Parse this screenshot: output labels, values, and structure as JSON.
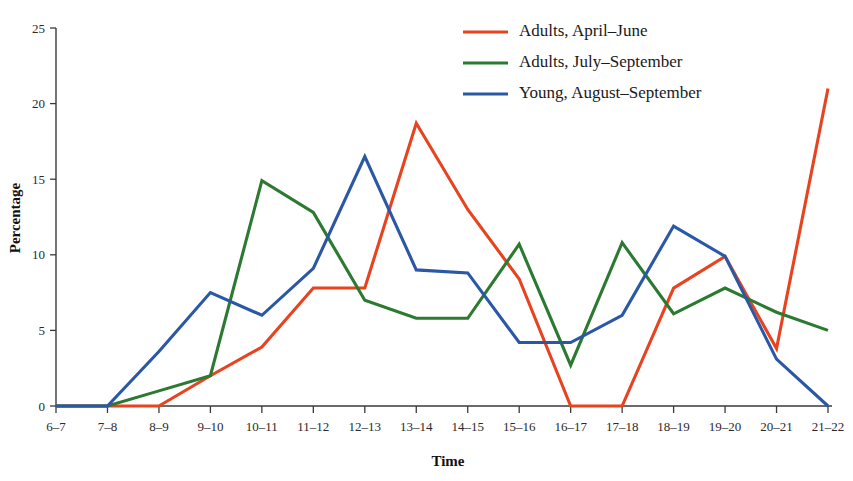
{
  "chart_data": {
    "type": "line",
    "title": "",
    "xlabel": "Time",
    "ylabel": "Percentage",
    "ylim": [
      0,
      25
    ],
    "yticks": [
      0,
      5,
      10,
      15,
      20,
      25
    ],
    "grid": false,
    "legend_position": "top-right",
    "categories": [
      "6–7",
      "7–8",
      "8–9",
      "9–10",
      "10–11",
      "11–12",
      "12–13",
      "13–14",
      "14–15",
      "15–16",
      "16–17",
      "17–18",
      "18–19",
      "19–20",
      "20–21",
      "21–22"
    ],
    "series": [
      {
        "name": "Adults, April–June",
        "color": "#e8431f",
        "values": [
          0,
          0,
          0,
          2.0,
          3.9,
          7.8,
          7.8,
          18.7,
          13.0,
          8.4,
          0,
          0,
          7.8,
          9.9,
          3.8,
          21.0
        ]
      },
      {
        "name": "Adults, July–September",
        "color": "#2c7a32",
        "values": [
          0,
          0,
          1.0,
          2.0,
          14.9,
          12.8,
          7.0,
          5.8,
          5.8,
          10.7,
          2.7,
          10.8,
          6.1,
          7.8,
          6.2,
          5.0
        ]
      },
      {
        "name": "Young, August–September",
        "color": "#2a58a6",
        "values": [
          0,
          0,
          3.6,
          7.5,
          6.0,
          9.1,
          16.5,
          9.0,
          8.8,
          4.2,
          4.2,
          6.0,
          11.9,
          9.9,
          3.1,
          0
        ]
      }
    ]
  },
  "axes": {
    "ylabel": "Percentage",
    "xlabel": "Time",
    "ytick_labels": [
      "0",
      "5",
      "10",
      "15",
      "20",
      "25"
    ]
  },
  "legend": {
    "entries": [
      {
        "label": "Adults, April–June",
        "color": "#e8431f"
      },
      {
        "label": "Adults, July–September",
        "color": "#2c7a32"
      },
      {
        "label": "Young, August–September",
        "color": "#2a58a6"
      }
    ]
  }
}
